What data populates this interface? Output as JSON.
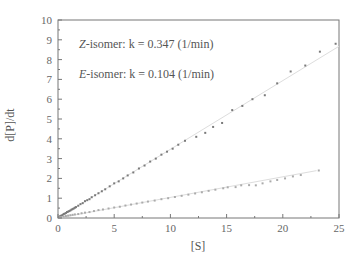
{
  "chart_data": {
    "type": "scatter",
    "title": "",
    "xlabel": "[S]",
    "ylabel": "d[P]/dt",
    "xlim": [
      0,
      25
    ],
    "ylim": [
      0,
      10
    ],
    "xticks": [
      0,
      5,
      10,
      15,
      20,
      25
    ],
    "yticks": [
      0,
      1,
      2,
      3,
      4,
      5,
      6,
      7,
      8,
      9,
      10
    ],
    "grid": false,
    "legend_position": "upper-left (inside, text annotations)",
    "annotations": [
      {
        "italic": "Z",
        "text": "-isomer: k = 0.347 (1/min)"
      },
      {
        "italic": "E",
        "text": "-isomer: k = 0.104 (1/min)"
      }
    ],
    "series": [
      {
        "name": "Z-isomer",
        "k": 0.347,
        "color": "#7a7a7a",
        "fit": {
          "slope": 0.347,
          "x_range": [
            0,
            25
          ]
        },
        "x": [
          0.1,
          0.2,
          0.3,
          0.4,
          0.5,
          0.6,
          0.7,
          0.8,
          0.9,
          1.0,
          1.1,
          1.2,
          1.3,
          1.4,
          1.5,
          1.6,
          1.8,
          2.0,
          2.2,
          2.4,
          2.6,
          2.8,
          3.0,
          3.3,
          3.6,
          3.9,
          4.2,
          4.6,
          5.0,
          5.4,
          5.8,
          6.2,
          6.7,
          7.2,
          7.7,
          8.2,
          8.7,
          9.2,
          9.7,
          10.2,
          10.7,
          11.3,
          12.3,
          13.1,
          13.8,
          14.6,
          15.5,
          16.4,
          17.3,
          18.4,
          19.5,
          20.7,
          22.0,
          23.3,
          24.7
        ],
        "y": [
          0.05,
          0.1,
          0.12,
          0.15,
          0.2,
          0.22,
          0.25,
          0.3,
          0.32,
          0.35,
          0.38,
          0.42,
          0.45,
          0.48,
          0.52,
          0.55,
          0.62,
          0.7,
          0.75,
          0.85,
          0.9,
          0.95,
          1.05,
          1.15,
          1.25,
          1.35,
          1.45,
          1.6,
          1.75,
          1.85,
          2.0,
          2.15,
          2.3,
          2.5,
          2.65,
          2.85,
          3.0,
          3.2,
          3.35,
          3.5,
          3.7,
          3.9,
          4.1,
          4.3,
          4.6,
          4.8,
          5.45,
          5.66,
          6.0,
          6.2,
          6.8,
          7.4,
          7.7,
          8.4,
          8.8
        ]
      },
      {
        "name": "E-isomer",
        "k": 0.104,
        "color": "#ababab",
        "fit": {
          "slope": 0.104,
          "x_range": [
            0,
            23
          ]
        },
        "x": [
          0.1,
          0.2,
          0.3,
          0.5,
          0.7,
          0.9,
          1.1,
          1.3,
          1.5,
          1.8,
          2.1,
          2.4,
          2.8,
          3.2,
          3.6,
          4.0,
          4.5,
          5.0,
          5.5,
          6.0,
          6.5,
          7.0,
          7.5,
          8.0,
          8.6,
          9.2,
          9.8,
          10.4,
          11.0,
          11.6,
          12.2,
          12.8,
          13.4,
          14.0,
          14.7,
          15.1,
          15.8,
          16.3,
          17.0,
          17.6,
          18.2,
          18.9,
          19.5,
          20.2,
          20.9,
          21.6,
          23.2
        ],
        "y": [
          0.02,
          0.03,
          0.05,
          0.07,
          0.1,
          0.12,
          0.14,
          0.16,
          0.18,
          0.2,
          0.24,
          0.27,
          0.3,
          0.35,
          0.4,
          0.43,
          0.48,
          0.53,
          0.57,
          0.63,
          0.68,
          0.73,
          0.78,
          0.83,
          0.88,
          0.95,
          1.0,
          1.06,
          1.12,
          1.18,
          1.24,
          1.3,
          1.37,
          1.43,
          1.5,
          1.55,
          1.56,
          1.65,
          1.66,
          1.65,
          1.75,
          1.85,
          1.92,
          2.0,
          2.1,
          2.17,
          2.4
        ]
      }
    ]
  },
  "axes": {
    "x_title": "[S]",
    "y_title": "d[P]/dt",
    "x_tick_labels": [
      "0",
      "5",
      "10",
      "15",
      "20",
      "25"
    ],
    "y_tick_labels": [
      "0",
      "1",
      "2",
      "3",
      "4",
      "5",
      "6",
      "7",
      "8",
      "9",
      "10"
    ]
  },
  "legend": {
    "z_italic": "Z",
    "z_text": "-isomer: k = 0.347 (1/min)",
    "e_italic": "E",
    "e_text": "-isomer: k = 0.104 (1/min)"
  }
}
